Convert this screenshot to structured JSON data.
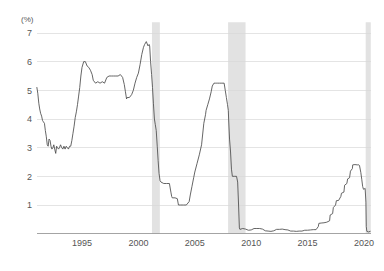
{
  "chart_data": {
    "type": "line",
    "title": "",
    "subtitle": "",
    "xlabel": "",
    "ylabel": "",
    "unit_label": "(%)",
    "xlim": [
      1991.0,
      2020.6
    ],
    "ylim": [
      0,
      7.2
    ],
    "grid": true,
    "legend": "none",
    "y_ticks": [
      1,
      2,
      3,
      4,
      5,
      6,
      7
    ],
    "y_tick_labels": [
      "1",
      "2",
      "3",
      "4",
      "5",
      "6",
      "7"
    ],
    "x_ticks": [
      1995,
      2000,
      2005,
      2010,
      2015,
      2020
    ],
    "x_tick_labels": [
      "1995",
      "2000",
      "2005",
      "2010",
      "2015",
      "2020"
    ],
    "series": [
      {
        "name": "Policy rate",
        "color": "#4a4a4a",
        "x": [
          1991.0,
          1991.08,
          1991.17,
          1991.25,
          1991.33,
          1991.42,
          1991.5,
          1991.58,
          1991.67,
          1991.75,
          1991.83,
          1991.92,
          1992.0,
          1992.08,
          1992.17,
          1992.25,
          1992.33,
          1992.42,
          1992.5,
          1992.58,
          1992.67,
          1992.75,
          1992.83,
          1992.92,
          1993.0,
          1993.1,
          1993.2,
          1993.3,
          1993.4,
          1993.5,
          1993.6,
          1993.7,
          1993.8,
          1993.9,
          1994.0,
          1994.1,
          1994.2,
          1994.3,
          1994.4,
          1994.5,
          1994.6,
          1994.7,
          1994.8,
          1994.9,
          1995.0,
          1995.15,
          1995.3,
          1995.45,
          1995.6,
          1995.75,
          1995.9,
          1996.0,
          1996.2,
          1996.4,
          1996.6,
          1996.8,
          1997.0,
          1997.2,
          1997.4,
          1997.6,
          1997.8,
          1998.0,
          1998.2,
          1998.4,
          1998.6,
          1998.75,
          1998.85,
          1998.95,
          1999.0,
          1999.2,
          1999.4,
          1999.55,
          1999.7,
          1999.85,
          2000.0,
          2000.15,
          2000.3,
          2000.45,
          2000.55,
          2000.7,
          2000.85,
          2000.95,
          2001.0,
          2001.08,
          2001.17,
          2001.25,
          2001.33,
          2001.42,
          2001.5,
          2001.58,
          2001.67,
          2001.75,
          2001.83,
          2001.92,
          2002.0,
          2002.25,
          2002.5,
          2002.75,
          2002.88,
          2002.95,
          2003.0,
          2003.25,
          2003.45,
          2003.55,
          2003.75,
          2003.95,
          2004.0,
          2004.25,
          2004.5,
          2004.6,
          2004.75,
          2004.9,
          2005.0,
          2005.2,
          2005.4,
          2005.6,
          2005.8,
          2005.95,
          2006.0,
          2006.15,
          2006.3,
          2006.45,
          2006.55,
          2006.7,
          2006.85,
          2006.95,
          2007.0,
          2007.2,
          2007.4,
          2007.6,
          2007.7,
          2007.8,
          2007.9,
          2007.97,
          2008.0,
          2008.08,
          2008.17,
          2008.25,
          2008.33,
          2008.5,
          2008.7,
          2008.8,
          2008.88,
          2008.95,
          2009.0,
          2009.25,
          2009.5,
          2009.75,
          2010.0,
          2010.25,
          2010.5,
          2010.75,
          2011.0,
          2011.25,
          2011.5,
          2011.75,
          2012.0,
          2012.25,
          2012.5,
          2012.75,
          2013.0,
          2013.25,
          2013.5,
          2013.75,
          2014.0,
          2014.25,
          2014.5,
          2014.75,
          2015.0,
          2015.25,
          2015.5,
          2015.75,
          2015.95,
          2016.0,
          2016.2,
          2016.45,
          2016.7,
          2016.95,
          2017.0,
          2017.22,
          2017.28,
          2017.48,
          2017.55,
          2017.75,
          2017.95,
          2018.0,
          2018.22,
          2018.28,
          2018.48,
          2018.55,
          2018.72,
          2018.8,
          2018.97,
          2019.0,
          2019.2,
          2019.4,
          2019.55,
          2019.6,
          2019.72,
          2019.8,
          2019.88,
          2019.95,
          2020.0,
          2020.1,
          2020.17,
          2020.2,
          2020.25,
          2020.4,
          2020.55
        ],
        "y": [
          5.1,
          4.9,
          4.55,
          4.35,
          4.2,
          4.1,
          3.95,
          3.9,
          3.85,
          3.6,
          3.4,
          3.1,
          3.05,
          3.3,
          3.25,
          3.05,
          2.95,
          3.0,
          3.1,
          2.95,
          2.8,
          3.05,
          3.0,
          2.95,
          3.0,
          3.1,
          3.0,
          2.95,
          3.05,
          2.95,
          3.05,
          3.0,
          2.95,
          3.05,
          3.05,
          3.25,
          3.5,
          3.75,
          4.05,
          4.25,
          4.5,
          4.8,
          5.1,
          5.5,
          5.8,
          6.0,
          6.0,
          5.85,
          5.8,
          5.7,
          5.55,
          5.35,
          5.25,
          5.3,
          5.25,
          5.3,
          5.25,
          5.45,
          5.5,
          5.5,
          5.5,
          5.5,
          5.5,
          5.55,
          5.45,
          5.2,
          4.95,
          4.7,
          4.75,
          4.75,
          4.85,
          5.0,
          5.25,
          5.45,
          5.6,
          5.9,
          6.25,
          6.5,
          6.6,
          6.7,
          6.55,
          6.6,
          6.55,
          6.0,
          5.55,
          5.1,
          4.55,
          4.0,
          3.8,
          3.6,
          3.05,
          2.55,
          2.1,
          1.85,
          1.8,
          1.75,
          1.75,
          1.75,
          1.45,
          1.3,
          1.25,
          1.25,
          1.22,
          1.0,
          1.0,
          1.0,
          1.0,
          1.0,
          1.12,
          1.35,
          1.65,
          1.95,
          2.15,
          2.45,
          2.75,
          3.1,
          3.85,
          4.15,
          4.3,
          4.5,
          4.7,
          4.95,
          5.15,
          5.25,
          5.25,
          5.25,
          5.25,
          5.25,
          5.25,
          5.25,
          5.0,
          4.75,
          4.5,
          4.3,
          4.0,
          3.3,
          2.85,
          2.25,
          2.0,
          2.0,
          2.0,
          1.8,
          1.0,
          0.2,
          0.15,
          0.18,
          0.16,
          0.12,
          0.13,
          0.18,
          0.18,
          0.18,
          0.16,
          0.1,
          0.09,
          0.08,
          0.1,
          0.15,
          0.15,
          0.16,
          0.14,
          0.13,
          0.09,
          0.09,
          0.08,
          0.09,
          0.09,
          0.12,
          0.12,
          0.13,
          0.14,
          0.14,
          0.25,
          0.36,
          0.37,
          0.38,
          0.4,
          0.45,
          0.65,
          0.7,
          0.91,
          1.0,
          1.15,
          1.16,
          1.3,
          1.41,
          1.45,
          1.69,
          1.75,
          1.91,
          1.95,
          2.18,
          2.27,
          2.4,
          2.41,
          2.4,
          2.4,
          2.38,
          2.13,
          1.9,
          1.65,
          1.55,
          1.55,
          1.58,
          1.1,
          0.25,
          0.08,
          0.06,
          0.08
        ]
      }
    ],
    "recession_bands": [
      {
        "start": 2001.2,
        "end": 2001.9,
        "label": "2001 recession"
      },
      {
        "start": 2007.95,
        "end": 2009.5,
        "label": "2008-09 recession"
      },
      {
        "start": 2020.15,
        "end": 2020.6,
        "label": "2020 recession"
      }
    ],
    "recession_color": "#e2e2e2",
    "gridline_color": "#d8d8d8",
    "axis_color": "#9a9a9a",
    "background_color": "#ffffff"
  }
}
